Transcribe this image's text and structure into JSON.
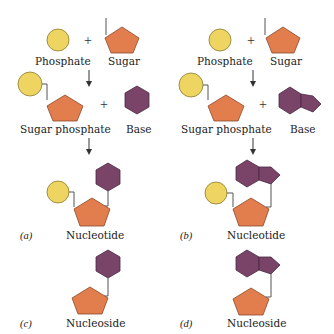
{
  "figure": {
    "panels": [
      {
        "id": "a",
        "panel_label": "(a)",
        "row1": {
          "left": "Phosphate",
          "op": "+",
          "right": "Sugar"
        },
        "row2": {
          "left": "Sugar phosphate",
          "op": "+",
          "right": "Base"
        },
        "product": "Nucleotide",
        "base_type": "single-ring (hexagon)"
      },
      {
        "id": "b",
        "panel_label": "(b)",
        "row1": {
          "left": "Phosphate",
          "op": "+",
          "right": "Sugar"
        },
        "row2": {
          "left": "Sugar phosphate",
          "op": "+",
          "right": "Base"
        },
        "product": "Nucleotide",
        "base_type": "double-ring (hexagon + pentagon)"
      },
      {
        "id": "c",
        "panel_label": "(c)",
        "product": "Nucleoside",
        "base_type": "single-ring (hexagon)"
      },
      {
        "id": "d",
        "panel_label": "(d)",
        "product": "Nucleoside",
        "base_type": "double-ring (hexagon + pentagon)"
      }
    ],
    "colors": {
      "phosphate": "#EED460",
      "sugar": "#E27D4E",
      "base": "#7A4468"
    }
  }
}
